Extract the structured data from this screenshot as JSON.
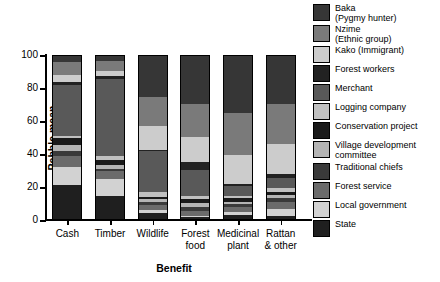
{
  "chart_data": {
    "type": "bar",
    "subtype": "stacked-percentage",
    "title": "",
    "xlabel": "Benefit",
    "ylabel": "Pebble mean",
    "ylim": [
      0,
      100
    ],
    "yticks": [
      0,
      20,
      40,
      60,
      80,
      100
    ],
    "grid": false,
    "legend_position": "right",
    "categories": [
      "Cash",
      "Timber",
      "Wildlife",
      "Forest\nfood",
      "Medicinal\nplant",
      "Rattan\n& other"
    ],
    "category_labels_flat": [
      "Cash",
      "Timber",
      "Wildlife",
      "Forest food",
      "Medicinal plant",
      "Rattan & other"
    ],
    "series": [
      {
        "name": "State",
        "color": "#1f1f1f",
        "values": [
          20.5,
          14.0,
          3.5,
          1.0,
          2.5,
          2.0
        ]
      },
      {
        "name": "Local government",
        "color": "#d2d2d2",
        "values": [
          11.0,
          10.5,
          2.0,
          1.0,
          2.0,
          4.0
        ]
      },
      {
        "name": "Forest service",
        "color": "#6b6b6b",
        "values": [
          6.5,
          4.5,
          3.0,
          3.0,
          3.0,
          4.5
        ]
      },
      {
        "name": "Traditional chiefs",
        "color": "#3a3a3a",
        "values": [
          3.5,
          1.5,
          2.0,
          2.5,
          1.5,
          2.0
        ]
      },
      {
        "name": "Village development committee",
        "color": "#b4b4b4",
        "values": [
          3.5,
          2.5,
          1.5,
          2.0,
          1.5,
          2.0
        ]
      },
      {
        "name": "Conservation project",
        "color": "#1a1a1a",
        "values": [
          4.0,
          3.0,
          1.5,
          2.5,
          2.0,
          2.0
        ]
      },
      {
        "name": "Logging company",
        "color": "#c0c0c0",
        "values": [
          1.5,
          2.0,
          3.0,
          2.0,
          1.5,
          2.5
        ]
      },
      {
        "name": "Merchant",
        "color": "#595959",
        "values": [
          31.0,
          47.0,
          24.5,
          16.0,
          6.0,
          6.0
        ]
      },
      {
        "name": "Forest workers",
        "color": "#222222",
        "values": [
          1.5,
          1.5,
          1.0,
          4.5,
          1.5,
          2.0
        ]
      },
      {
        "name": "Kako (Immigrant)",
        "color": "#cccccc",
        "values": [
          4.5,
          3.0,
          14.5,
          15.5,
          17.5,
          18.5
        ]
      },
      {
        "name": "Nzime (Ethnic group)",
        "color": "#7a7a7a",
        "values": [
          7.5,
          6.0,
          17.5,
          20.0,
          25.5,
          24.5
        ]
      },
      {
        "name": "Baka (Pygmy hunter)",
        "color": "#363636",
        "values": [
          5.0,
          4.5,
          26.0,
          30.0,
          35.5,
          30.0
        ]
      }
    ],
    "legend_entries": [
      {
        "label": "Baka\n(Pygmy hunter)",
        "color": "#363636"
      },
      {
        "label": "Nzime\n(Ethnic group)",
        "color": "#7a7a7a"
      },
      {
        "label": "Kako (Immigrant)",
        "color": "#cccccc"
      },
      {
        "label": "Forest workers",
        "color": "#222222"
      },
      {
        "label": "Merchant",
        "color": "#595959"
      },
      {
        "label": "Logging company",
        "color": "#c0c0c0"
      },
      {
        "label": "Conservation project",
        "color": "#1a1a1a"
      },
      {
        "label": "Village development\ncommittee",
        "color": "#b4b4b4"
      },
      {
        "label": "Traditional chiefs",
        "color": "#3a3a3a"
      },
      {
        "label": "Forest service",
        "color": "#6b6b6b"
      },
      {
        "label": "Local government",
        "color": "#d2d2d2"
      },
      {
        "label": "State",
        "color": "#1f1f1f"
      }
    ]
  }
}
